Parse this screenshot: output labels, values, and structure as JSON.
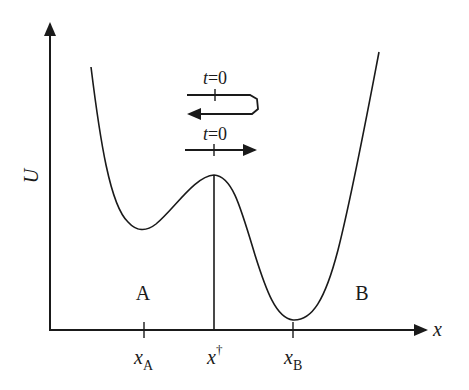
{
  "diagram": {
    "title": "",
    "axes": {
      "y_label": "U",
      "x_label": "x"
    },
    "x_ticks": [
      {
        "base": "x",
        "sub": "A",
        "sup": ""
      },
      {
        "base": "x",
        "sub": "",
        "sup": "†"
      },
      {
        "base": "x",
        "sub": "B",
        "sup": ""
      }
    ],
    "wells": {
      "left": "A",
      "right": "B"
    },
    "trajectories": [
      {
        "label": "t=0",
        "label_t": "t",
        "label_rest": "=0",
        "kind": "recrossing"
      },
      {
        "label": "t=0",
        "label_t": "t",
        "label_rest": "=0",
        "kind": "direct-crossing"
      }
    ],
    "colors": {
      "line": "#1a1a1a",
      "background": "#ffffff"
    }
  }
}
